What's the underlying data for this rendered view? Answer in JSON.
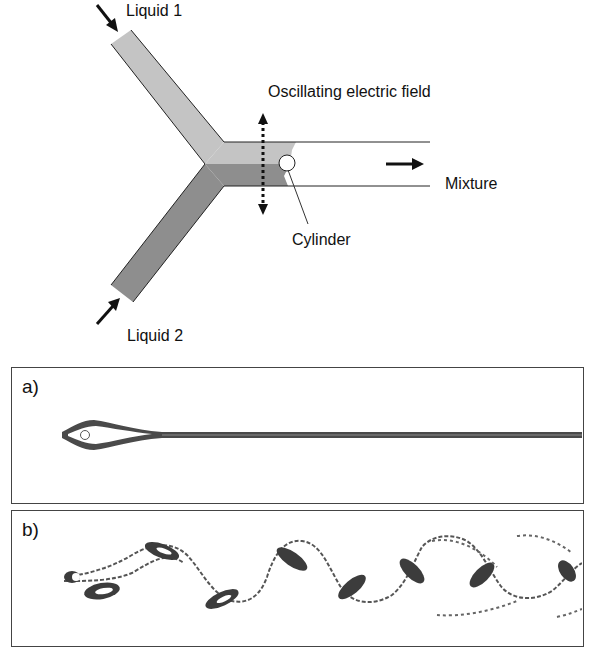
{
  "figure": {
    "schematic": {
      "labels": {
        "liquid1": "Liquid 1",
        "liquid2": "Liquid 2",
        "field": "Oscillating electric field",
        "mixture": "Mixture",
        "cylinder": "Cylinder"
      },
      "colors": {
        "liquid1_fill": "#c4c4c4",
        "liquid2_fill": "#8e8e8e",
        "outline": "#222222",
        "arrow": "#111111"
      }
    },
    "panels": [
      {
        "id": "a",
        "label": "a)",
        "description": "steady wake without oscillating field"
      },
      {
        "id": "b",
        "label": "b)",
        "description": "vortex shedding with oscillating field"
      }
    ]
  }
}
